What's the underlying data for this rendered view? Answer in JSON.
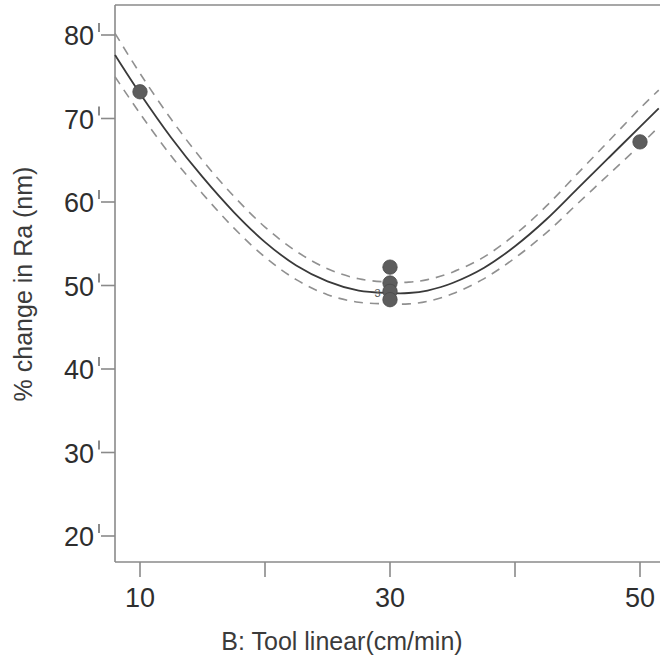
{
  "chart_data": {
    "type": "line",
    "title": "",
    "subtitle": "",
    "xlabel": "B: Tool linear(cm/min)",
    "ylabel": "% change in Ra (nm)",
    "xlim": [
      6,
      52
    ],
    "ylim": [
      17.5,
      83
    ],
    "xticks": [
      10,
      20,
      30,
      40,
      50
    ],
    "xtick_labels": [
      "10",
      "",
      "30",
      "",
      "50"
    ],
    "yticks": [
      20,
      30,
      40,
      50,
      60,
      70,
      80
    ],
    "ytick_labels": [
      "20",
      "30",
      "40",
      "50",
      "60",
      "70",
      "80"
    ],
    "grid": false,
    "legend": "none",
    "series": [
      {
        "name": "Predicted fit",
        "style": "solid",
        "color": "#3a3a3a",
        "x": [
          8.0,
          10.0,
          12.5,
          15.0,
          17.5,
          20.0,
          22.5,
          25.0,
          27.5,
          30.0,
          31.5,
          33.0,
          35.0,
          37.5,
          40.0,
          42.5,
          45.0,
          47.5,
          50.0,
          51.5
        ],
        "values": [
          77.6,
          73.0,
          67.7,
          63.0,
          58.8,
          55.2,
          52.4,
          50.5,
          49.4,
          49.1,
          49.1,
          49.4,
          50.3,
          52.1,
          54.7,
          57.9,
          61.6,
          65.3,
          69.0,
          71.2
        ]
      },
      {
        "name": "95% CI upper",
        "style": "dashed",
        "color": "#909090",
        "x": [
          8.0,
          10.0,
          12.5,
          15.0,
          17.5,
          20.0,
          22.5,
          25.0,
          27.5,
          30.0,
          31.5,
          33.0,
          35.0,
          37.5,
          40.0,
          42.5,
          45.0,
          47.5,
          50.0,
          51.5
        ],
        "values": [
          80.2,
          75.4,
          69.9,
          65.0,
          60.7,
          57.0,
          54.1,
          52.0,
          50.8,
          50.4,
          50.4,
          50.7,
          51.6,
          53.4,
          56.1,
          59.5,
          63.4,
          67.3,
          71.2,
          73.4
        ]
      },
      {
        "name": "95% CI lower",
        "style": "dashed",
        "color": "#909090",
        "x": [
          8.0,
          10.0,
          12.5,
          15.0,
          17.5,
          20.0,
          22.5,
          25.0,
          27.5,
          30.0,
          31.5,
          33.0,
          35.0,
          37.5,
          40.0,
          42.5,
          45.0,
          47.5,
          50.0,
          51.5
        ],
        "values": [
          75.0,
          70.6,
          65.5,
          61.0,
          56.9,
          53.4,
          50.7,
          48.9,
          48.0,
          47.8,
          47.8,
          48.1,
          49.0,
          50.8,
          53.3,
          56.3,
          59.8,
          63.3,
          66.8,
          69.0
        ]
      }
    ],
    "points": [
      {
        "x": 10,
        "y": 73.2
      },
      {
        "x": 30,
        "y": 52.2
      },
      {
        "x": 30,
        "y": 50.3
      },
      {
        "x": 30,
        "y": 49.3
      },
      {
        "x": 30,
        "y": 48.3
      },
      {
        "x": 50,
        "y": 67.2
      }
    ],
    "annotations": [
      {
        "text": "3",
        "x": 29.0,
        "y": 48.6,
        "note": "overlap count marker"
      }
    ],
    "colors": {
      "point_fill": "#5d5d5d",
      "fit_line": "#3a3a3a",
      "ci_line": "#909090",
      "axis": "#8a8a8a",
      "text": "#2e2e2e",
      "background": "#ffffff"
    }
  }
}
